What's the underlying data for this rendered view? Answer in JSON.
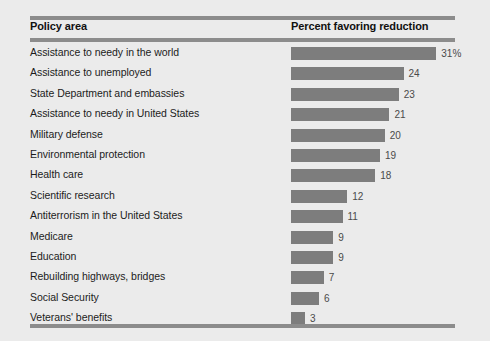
{
  "table": {
    "columns": {
      "policy_area": "Policy area",
      "percent": "Percent favoring reduction"
    }
  },
  "colors": {
    "background": "#ebebeb",
    "bar": "#7d7d7d",
    "rule": "#8c8c8c",
    "label_text": "#1c1c1c",
    "value_text": "#4a4a4a"
  },
  "chart_data": {
    "type": "bar",
    "orientation": "horizontal",
    "title": "",
    "subtitle": "",
    "xlabel": "Percent favoring reduction",
    "ylabel": "Policy area",
    "grid": false,
    "legend": null,
    "xlim": [
      0,
      35
    ],
    "categories": [
      "Assistance to needy in the world",
      "Assistance to unemployed",
      "State Department and embassies",
      "Assistance to needy in United States",
      "Military defense",
      "Environmental protection",
      "Health care",
      "Scientific research",
      "Antiterrorism in the United States",
      "Medicare",
      "Education",
      "Rebuilding highways, bridges",
      "Social Security",
      "Veterans' benefits"
    ],
    "values": [
      31,
      24,
      23,
      21,
      20,
      19,
      18,
      12,
      11,
      9,
      9,
      7,
      6,
      3
    ],
    "value_labels": [
      "31%",
      "24",
      "23",
      "21",
      "20",
      "19",
      "18",
      "12",
      "11",
      "9",
      "9",
      "7",
      "6",
      "3"
    ]
  }
}
